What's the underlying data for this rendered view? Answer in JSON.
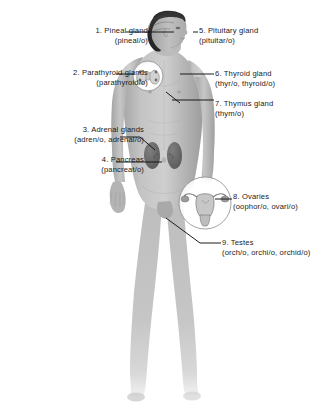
{
  "figure": {
    "background_color": "#ffffff",
    "body_fill": "#b9b9b9",
    "organ_fill": "#6f6f6f",
    "hair_color": "#2b2b2b",
    "line_color": "#1a1a1a",
    "text_color": "#1a1a1a"
  },
  "labels": {
    "pineal": {
      "number": "1.",
      "name": "Pineal gland",
      "combining": "(pineal/o)"
    },
    "parathyroid": {
      "number": "2.",
      "name": "Parathyroid glands",
      "combining": "(parathyroid/o)"
    },
    "adrenal": {
      "number": "3.",
      "name": "Adrenal glands",
      "combining": "(adren/o, adrenal/o)"
    },
    "pancreas": {
      "number": "4.",
      "name": "Pancreas",
      "combining": "(pancreat/o)"
    },
    "pituitary": {
      "number": "5.",
      "name": "Pituitary gland",
      "combining": "(pituitar/o)"
    },
    "thyroid": {
      "number": "6.",
      "name": "Thyroid gland",
      "combining": "(thyr/o, thyroid/o)"
    },
    "thymus": {
      "number": "7.",
      "name": "Thymus gland",
      "combining": "(thym/o)"
    },
    "ovaries": {
      "number": "8.",
      "name": "Ovaries",
      "combining": "(oophor/o, ovari/o)"
    },
    "testes": {
      "number": "9.",
      "name": "Testes",
      "combining": "(orch/o, orchi/o, orchid/o)"
    }
  },
  "insets": [
    {
      "name": "thyroid-parathyroid-inset",
      "cx": 148,
      "cy": 76,
      "r": 15
    },
    {
      "name": "uterus-ovaries-inset",
      "cx": 205,
      "cy": 203,
      "r": 26
    }
  ],
  "organs": [
    {
      "name": "adrenal-gland-left",
      "x": 152,
      "y": 152
    },
    {
      "name": "adrenal-gland-right",
      "x": 171,
      "y": 152
    }
  ]
}
